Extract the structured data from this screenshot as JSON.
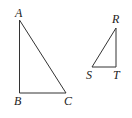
{
  "diagram": {
    "triangles": [
      {
        "name": "ABC",
        "vertices": [
          {
            "label": "A",
            "x": 19.5,
            "y": 20,
            "lx": 15,
            "ly": 17
          },
          {
            "label": "B",
            "x": 19.5,
            "y": 93,
            "lx": 14,
            "ly": 105
          },
          {
            "label": "C",
            "x": 66,
            "y": 93,
            "lx": 64,
            "ly": 105
          }
        ]
      },
      {
        "name": "RST",
        "vertices": [
          {
            "label": "R",
            "x": 116,
            "y": 28,
            "lx": 112,
            "ly": 23
          },
          {
            "label": "S",
            "x": 92,
            "y": 67,
            "lx": 86,
            "ly": 79
          },
          {
            "label": "T",
            "x": 116,
            "y": 67,
            "lx": 113,
            "ly": 79
          }
        ]
      }
    ]
  }
}
